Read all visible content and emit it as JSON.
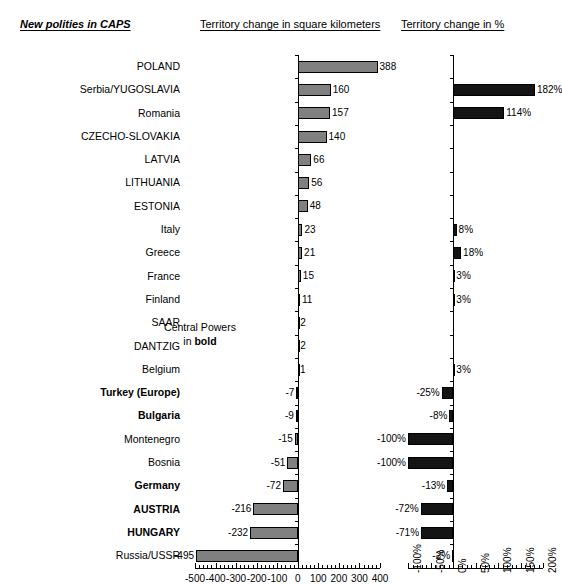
{
  "headers": {
    "left_note": "New polities in CAPS",
    "km_title": "Territory change in square kilometers",
    "pct_title": "Territory change in %"
  },
  "annotation": {
    "line1": "Central Powers",
    "line2_prefix": "in ",
    "line2_bold": "bold"
  },
  "chart_data": {
    "type": "bar",
    "orientation": "horizontal",
    "grid": false,
    "legend": null,
    "categories": [
      "POLAND",
      "Serbia/YUGOSLAVIA",
      "Romania",
      "CZECHO-SLOVAKIA",
      "LATVIA",
      "LITHUANIA",
      "ESTONIA",
      "Italy",
      "Greece",
      "France",
      "Finland",
      "SAAR",
      "DANTZIG",
      "Belgium",
      "Turkey (Europe)",
      "Bulgaria",
      "Montenegro",
      "Bosnia",
      "Germany",
      "AUSTRIA",
      "HUNGARY",
      "Russia/USSR"
    ],
    "bold_categories": [
      "Turkey (Europe)",
      "Bulgaria",
      "Germany",
      "AUSTRIA",
      "HUNGARY"
    ],
    "series": [
      {
        "name": "Territory change in square kilometers",
        "unit": "thousand km²",
        "xlabel": "",
        "xlim": [
          -500,
          400
        ],
        "xticks": [
          -500,
          -400,
          -300,
          -200,
          -100,
          0,
          100,
          200,
          300,
          400
        ],
        "xticklabels": [
          "-500",
          "-400",
          "-300",
          "-200",
          "-100",
          "0",
          "100",
          "200",
          "300",
          "400"
        ],
        "values": [
          388,
          160,
          157,
          140,
          66,
          56,
          48,
          23,
          21,
          15,
          11,
          2,
          2,
          1,
          -7,
          -9,
          -15,
          -51,
          -72,
          -216,
          -232,
          -495
        ],
        "datalabels": [
          "388",
          "160",
          "157",
          "140",
          "66",
          "56",
          "48",
          "23",
          "21",
          "15",
          "11",
          "2",
          "2",
          "1",
          "-7",
          "-9",
          "-15",
          "-51",
          "-72",
          "-216",
          "-232",
          "-495"
        ],
        "color": "#808080"
      },
      {
        "name": "Territory change in %",
        "unit": "%",
        "xlabel": "",
        "xlim": [
          -100,
          200
        ],
        "xticks": [
          -100,
          -50,
          0,
          50,
          100,
          150,
          200
        ],
        "xticklabels": [
          "-100%",
          "-50%",
          "0%",
          "50%",
          "100%",
          "150%",
          "200%"
        ],
        "values": [
          null,
          182,
          114,
          null,
          null,
          null,
          null,
          8,
          18,
          3,
          3,
          null,
          null,
          3,
          -25,
          -8,
          -100,
          -100,
          -13,
          -72,
          -71,
          -2
        ],
        "datalabels": [
          null,
          "182%",
          "114%",
          null,
          null,
          null,
          null,
          "8%",
          "18%",
          "3%",
          "3%",
          null,
          null,
          "3%",
          "-25%",
          "-8%",
          "-100%",
          "-100%",
          "-13%",
          "-72%",
          "-71%",
          "-2%"
        ],
        "color": "#141414"
      }
    ]
  }
}
